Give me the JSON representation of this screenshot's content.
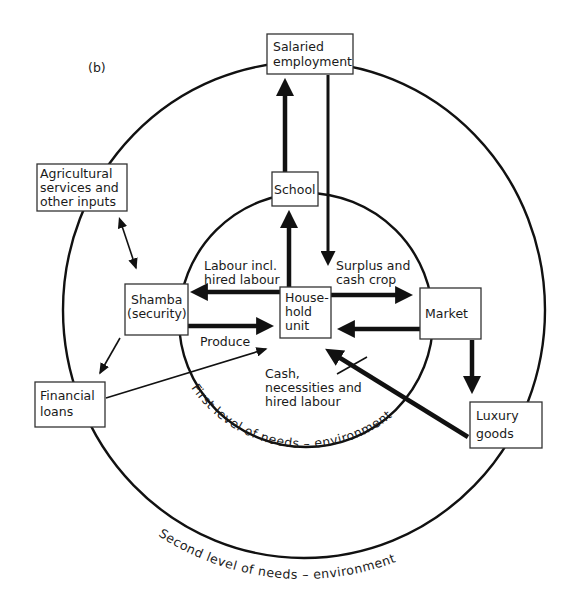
{
  "figure": {
    "panel_label": "(b)",
    "rings": {
      "inner_label": "First level of needs – environment",
      "outer_label": "Second level of needs – environment"
    },
    "nodes": {
      "salaried": {
        "line1": "Salaried",
        "line2": "employment"
      },
      "school": {
        "line1": "School"
      },
      "agri": {
        "line1": "Agricultural",
        "line2": "services and",
        "line3": "other inputs"
      },
      "shamba": {
        "line1": "Shamba",
        "line2": "(security)"
      },
      "household": {
        "line1": "House-",
        "line2": "hold",
        "line3": "unit"
      },
      "market": {
        "line1": "Market"
      },
      "loans": {
        "line1": "Financial",
        "line2": "loans"
      },
      "luxury": {
        "line1": "Luxury",
        "line2": "goods"
      }
    },
    "edge_labels": {
      "labour": {
        "line1": "Labour incl.",
        "line2": "hired labour"
      },
      "surplus": {
        "line1": "Surplus and",
        "line2": "cash crop"
      },
      "produce": {
        "line1": "Produce"
      },
      "cash": {
        "line1": "Cash,",
        "line2": "necessities and",
        "line3": "hired labour"
      }
    },
    "edges": [
      {
        "from": "household",
        "to": "school",
        "weight": "thick"
      },
      {
        "from": "school",
        "to": "salaried",
        "weight": "thick"
      },
      {
        "from": "salaried",
        "to": "household",
        "weight": "thick"
      },
      {
        "from": "household",
        "to": "shamba",
        "label": "Labour incl. hired labour",
        "weight": "thick"
      },
      {
        "from": "shamba",
        "to": "household",
        "label": "Produce",
        "weight": "thick"
      },
      {
        "from": "household",
        "to": "market",
        "label": "Surplus and cash crop",
        "weight": "thick"
      },
      {
        "from": "market",
        "to": "household",
        "label": "Cash, necessities and hired labour",
        "weight": "thick"
      },
      {
        "from": "market",
        "to": "luxury",
        "weight": "thick"
      },
      {
        "from": "luxury",
        "to": "household",
        "weight": "thick"
      },
      {
        "from": "agri",
        "to": "shamba",
        "bidirectional": true,
        "weight": "thin"
      },
      {
        "from": "shamba",
        "to": "loans",
        "weight": "thin"
      },
      {
        "from": "loans",
        "to": "household",
        "weight": "thin"
      }
    ]
  }
}
